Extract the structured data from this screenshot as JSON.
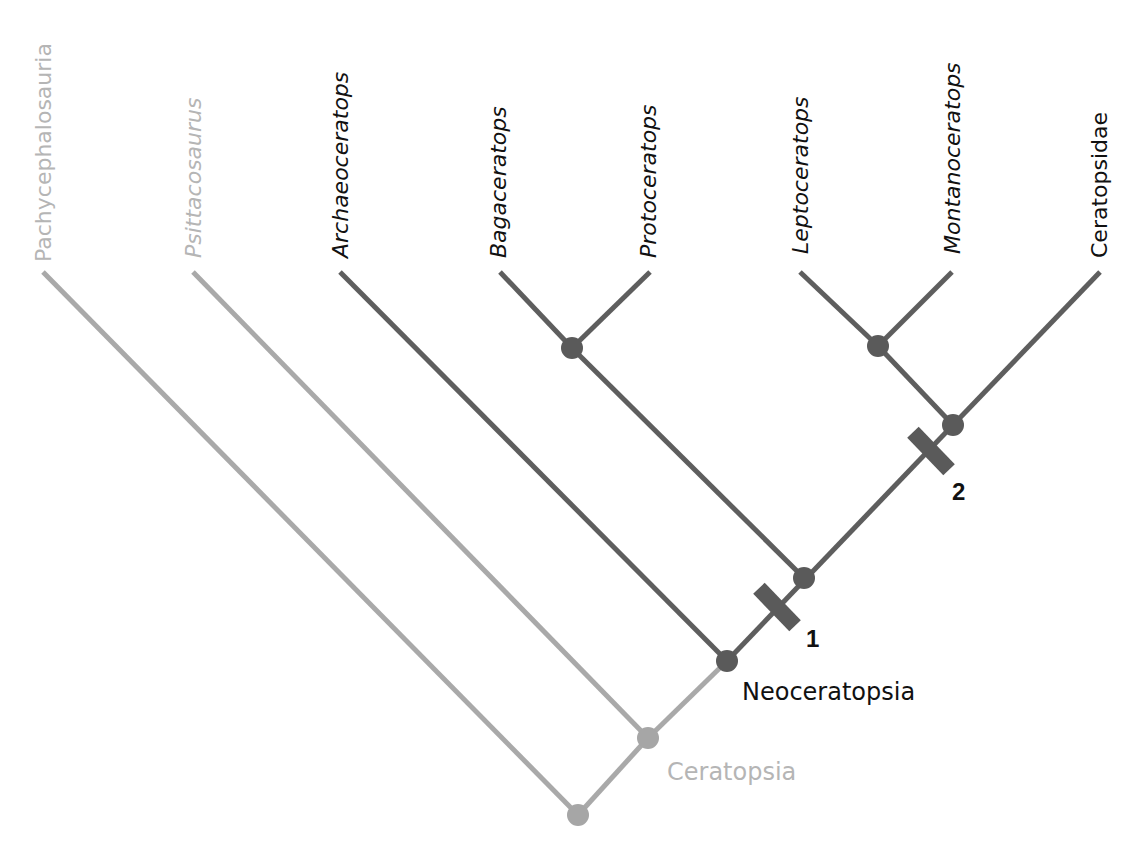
{
  "colors": {
    "outgroup_line": "#a9a9a9",
    "ingroup_line": "#5e5e5e",
    "outgroup_node": "#a6a6a6",
    "ingroup_node": "#5a5a5a",
    "outgroup_text": "#b5b5b5",
    "ingroup_text": "#111111",
    "marker_fill": "#5a5a5a",
    "background": "#ffffff"
  },
  "taxa": [
    {
      "id": "pachycephalosauria",
      "label": "Pachycephalosauria",
      "italic": false,
      "muted": true
    },
    {
      "id": "psittacosaurus",
      "label": "Psittacosaurus",
      "italic": true,
      "muted": true
    },
    {
      "id": "archaeoceratops",
      "label": "Archaeoceratops",
      "italic": true,
      "muted": false
    },
    {
      "id": "bagaceratops",
      "label": "Bagaceratops",
      "italic": true,
      "muted": false
    },
    {
      "id": "protoceratops",
      "label": "Protoceratops",
      "italic": true,
      "muted": false
    },
    {
      "id": "leptoceratops",
      "label": "Leptoceratops",
      "italic": true,
      "muted": false
    },
    {
      "id": "montanoceratops",
      "label": "Montanoceratops",
      "italic": true,
      "muted": false
    },
    {
      "id": "ceratopsidae",
      "label": "Ceratopsidae",
      "italic": false,
      "muted": false
    }
  ],
  "clades": {
    "ceratopsia": {
      "label": "Ceratopsia",
      "muted": true
    },
    "neoceratopsia": {
      "label": "Neoceratopsia",
      "muted": false
    }
  },
  "markers": [
    {
      "id": "marker-1",
      "label": "1"
    },
    {
      "id": "marker-2",
      "label": "2"
    }
  ],
  "tree": {
    "topology": "(Pachycephalosauria,(Psittacosaurus,(Archaeoceratops,((Bagaceratops,Protoceratops),((Leptoceratops,Montanoceratops),Ceratopsidae)))))"
  }
}
